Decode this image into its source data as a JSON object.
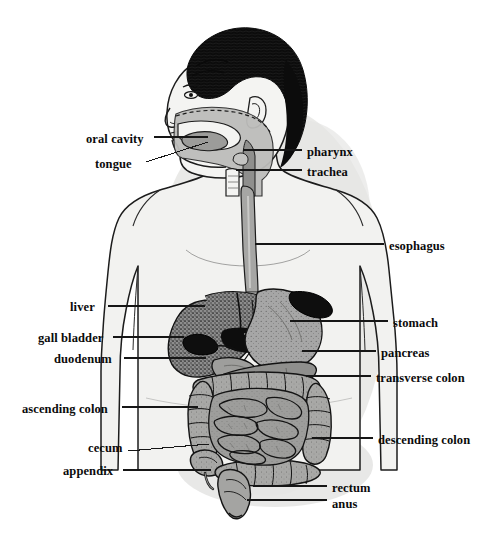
{
  "figure": {
    "caption_fragment": "",
    "width": 494,
    "height": 540,
    "background_color": "#ffffff",
    "body_fill_color": "#f0f0ee",
    "body_outline_color": "#1a1a1a",
    "hair_color": "#0d0d0d",
    "organ_gray": "#9a9a9a",
    "organ_dark": "#111111",
    "shadow_color": "#e3e3e1",
    "label_color": "#0b0b0b",
    "leader_line_color": "#161616"
  },
  "labels": {
    "left": [
      {
        "id": "oral-cavity",
        "text": "oral cavity",
        "text_x": 86,
        "text_y": 133,
        "line_from_x": 154,
        "line_from_y": 137,
        "line_to_x": 208,
        "line_to_y": 137
      },
      {
        "id": "tongue",
        "text": "tongue",
        "text_x": 95,
        "text_y": 158,
        "line_from_x": 146,
        "line_from_y": 162,
        "line_to_x": 208,
        "line_to_y": 142
      },
      {
        "id": "liver",
        "text": "liver",
        "text_x": 70,
        "text_y": 301,
        "line_from_x": 108,
        "line_from_y": 306,
        "line_to_x": 205,
        "line_to_y": 306
      },
      {
        "id": "gall-bladder",
        "text": "gall bladder",
        "text_x": 38,
        "text_y": 332,
        "line_from_x": 113,
        "line_from_y": 337,
        "line_to_x": 184,
        "line_to_y": 337
      },
      {
        "id": "duodenum",
        "text": "duodenum",
        "text_x": 54,
        "text_y": 353,
        "line_from_x": 124,
        "line_from_y": 358,
        "line_to_x": 206,
        "line_to_y": 358
      },
      {
        "id": "ascending-colon",
        "text": "ascending colon",
        "text_x": 22,
        "text_y": 403,
        "line_from_x": 122,
        "line_from_y": 407,
        "line_to_x": 198,
        "line_to_y": 407
      },
      {
        "id": "cecum",
        "text": "cecum",
        "text_x": 88,
        "text_y": 442,
        "line_from_x": 128,
        "line_from_y": 451,
        "line_to_x": 209,
        "line_to_y": 444
      },
      {
        "id": "appendix",
        "text": "appendix",
        "text_x": 63,
        "text_y": 465,
        "line_from_x": 123,
        "line_from_y": 470,
        "line_to_x": 211,
        "line_to_y": 470
      }
    ],
    "right": [
      {
        "id": "pharynx",
        "text": "pharynx",
        "text_x": 307,
        "text_y": 146,
        "line_from_x": 302,
        "line_from_y": 150,
        "line_to_x": 243,
        "line_to_y": 150
      },
      {
        "id": "trachea",
        "text": "trachea",
        "text_x": 307,
        "text_y": 166,
        "line_from_x": 302,
        "line_from_y": 170,
        "line_to_x": 236,
        "line_to_y": 170
      },
      {
        "id": "esophagus",
        "text": "esophagus",
        "text_x": 389,
        "text_y": 240,
        "line_from_x": 384,
        "line_from_y": 244,
        "line_to_x": 255,
        "line_to_y": 244
      },
      {
        "id": "stomach",
        "text": "stomach",
        "text_x": 393,
        "text_y": 317,
        "line_from_x": 388,
        "line_from_y": 321,
        "line_to_x": 290,
        "line_to_y": 321
      },
      {
        "id": "pancreas",
        "text": "pancreas",
        "text_x": 381,
        "text_y": 347,
        "line_from_x": 376,
        "line_from_y": 351,
        "line_to_x": 302,
        "line_to_y": 351
      },
      {
        "id": "transverse-colon",
        "text": "transverse colon",
        "text_x": 376,
        "text_y": 372,
        "line_from_x": 371,
        "line_from_y": 376,
        "line_to_x": 306,
        "line_to_y": 376
      },
      {
        "id": "descending-colon",
        "text": "descending colon",
        "text_x": 378,
        "text_y": 434,
        "line_from_x": 373,
        "line_from_y": 438,
        "line_to_x": 312,
        "line_to_y": 438
      },
      {
        "id": "rectum",
        "text": "rectum",
        "text_x": 332,
        "text_y": 482,
        "line_from_x": 327,
        "line_from_y": 486,
        "line_to_x": 253,
        "line_to_y": 486
      },
      {
        "id": "anus",
        "text": "anus",
        "text_x": 332,
        "text_y": 498,
        "line_from_x": 327,
        "line_from_y": 500,
        "line_to_x": 247,
        "line_to_y": 500
      }
    ]
  },
  "organ_list": [
    "oral cavity",
    "tongue",
    "pharynx",
    "trachea",
    "esophagus",
    "liver",
    "gall bladder",
    "duodenum",
    "stomach",
    "pancreas",
    "transverse colon",
    "ascending colon",
    "descending colon",
    "cecum",
    "appendix",
    "rectum",
    "anus"
  ]
}
